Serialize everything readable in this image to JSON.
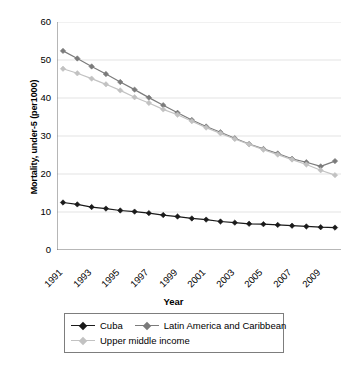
{
  "chart_data": {
    "type": "line",
    "title": "",
    "xlabel": "Year",
    "ylabel": "Mortality, under-5 (per1000)",
    "ylim": [
      0,
      60
    ],
    "yticks": [
      0,
      10,
      20,
      30,
      40,
      50,
      60
    ],
    "grid": "horizontal",
    "legend_position": "bottom",
    "x": [
      1991,
      1992,
      1993,
      1994,
      1995,
      1996,
      1997,
      1998,
      1999,
      2000,
      2001,
      2002,
      2003,
      2004,
      2005,
      2006,
      2007,
      2008,
      2009,
      2010
    ],
    "xtick_labels": [
      "1991",
      "1993",
      "1995",
      "1997",
      "1999",
      "2001",
      "2003",
      "2005",
      "2007",
      "2009"
    ],
    "xtick_values": [
      1991,
      1993,
      1995,
      1997,
      1999,
      2001,
      2003,
      2005,
      2007,
      2009
    ],
    "series": [
      {
        "name": "Cuba",
        "color": "#1a1a1a",
        "marker": "diamond",
        "values": [
          12.5,
          12.0,
          11.3,
          10.9,
          10.4,
          10.1,
          9.7,
          9.2,
          8.8,
          8.3,
          8.0,
          7.5,
          7.2,
          6.9,
          6.8,
          6.6,
          6.4,
          6.2,
          6.0,
          5.9
        ]
      },
      {
        "name": "Latin America and Caribbean",
        "color": "#7b7b7b",
        "marker": "diamond",
        "values": [
          52.4,
          50.4,
          48.3,
          46.3,
          44.2,
          42.2,
          40.1,
          38.1,
          36.1,
          34.2,
          32.5,
          31.0,
          29.4,
          27.9,
          26.6,
          25.4,
          24.0,
          23.1,
          22.0,
          23.4
        ]
      },
      {
        "name": "Upper middle income",
        "color": "#c2c2c2",
        "marker": "diamond",
        "values": [
          47.7,
          46.5,
          45.1,
          43.6,
          42.0,
          40.2,
          38.7,
          37.0,
          35.6,
          33.9,
          32.2,
          30.7,
          29.2,
          27.8,
          26.4,
          25.1,
          23.8,
          22.5,
          21.0,
          19.7
        ]
      }
    ]
  },
  "axis": {
    "x_title": "Year",
    "y_title": "Mortality, under-5 (per1000)"
  },
  "legend": {
    "items": [
      {
        "label": "Cuba",
        "color": "#1a1a1a"
      },
      {
        "label": "Latin America and Caribbean",
        "color": "#7b7b7b"
      },
      {
        "label": "Upper middle income",
        "color": "#c2c2c2"
      }
    ]
  },
  "colors": {
    "axis": "#6f6f6f",
    "grid": "#e3e3e3",
    "legend_border": "#7d7d7d",
    "background": "#ffffff"
  }
}
